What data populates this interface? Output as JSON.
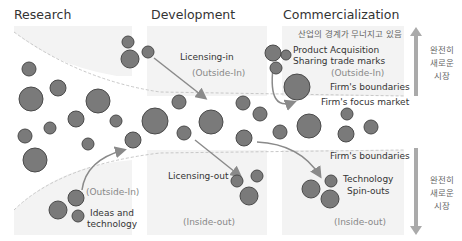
{
  "top_cut_text": "",
  "headers": {
    "research": "Research",
    "development": "Development",
    "commercialization": "Commercialization"
  },
  "labels": {
    "industry_boundary_kr": "산업의 경계가 무너지고 있음",
    "licensing_in": "Licensing-in",
    "licensing_in_dir": "(Outside-In)",
    "product_acquisition": "Product Acquisition",
    "sharing_trade_marks": "Sharing trade marks",
    "commercial_outside_in": "(Outside-In)",
    "firms_boundaries_top": "Firm's boundaries",
    "firms_focus_market": "Firm's focus market",
    "firms_boundaries_bottom": "Firm's boundaries",
    "research_outside_in": "(Outside-In)",
    "ideas_line1": "Ideas and",
    "ideas_line2": "technology",
    "licensing_out": "Licensing-out",
    "licensing_out_dir": "(Inside-out)",
    "tech_line1": "Technology",
    "tech_line2": "Spin-outs",
    "spinout_dir": "(Inside-out)"
  },
  "side_labels": {
    "top": [
      "완전히",
      "새로운",
      "시장"
    ],
    "bottom": [
      "완전히",
      "새로운",
      "시장"
    ]
  },
  "colors": {
    "circle_fill": "#7a7a7a",
    "circle_stroke": "#4a4a4a",
    "arrow": "#8a8a8a",
    "panel_bg": "#f3f3f3",
    "dashed": "#c8c8c8",
    "side_arrow": "#aaaaaa"
  }
}
